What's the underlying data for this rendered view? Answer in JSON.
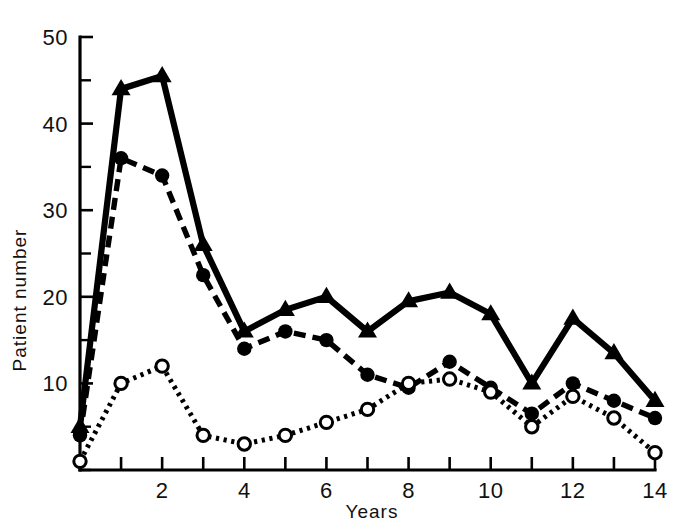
{
  "chart_data": {
    "type": "line",
    "title": "",
    "xlabel": "Years",
    "ylabel": "Patient number",
    "xlim": [
      0,
      14
    ],
    "ylim": [
      0,
      50
    ],
    "grid": false,
    "legend_position": "none",
    "x": [
      0,
      1,
      2,
      3,
      4,
      5,
      6,
      7,
      8,
      9,
      10,
      11,
      12,
      13,
      14
    ],
    "x_tick_values": [
      0,
      1,
      2,
      3,
      4,
      5,
      6,
      7,
      8,
      9,
      10,
      11,
      12,
      13,
      14
    ],
    "x_tick_labels": [
      "",
      "",
      "2",
      "",
      "4",
      "",
      "6",
      "",
      "8",
      "",
      "10",
      "",
      "12",
      "",
      "14"
    ],
    "y_tick_values": [
      0,
      5,
      10,
      15,
      20,
      25,
      30,
      35,
      40,
      45,
      50
    ],
    "y_tick_labels": [
      "",
      "",
      "10",
      "",
      "20",
      "",
      "30",
      "",
      "40",
      "",
      "50"
    ],
    "series": [
      {
        "name": "solid-triangle-series",
        "marker": "triangle",
        "line_style": "solid",
        "color": "#000000",
        "values": [
          5,
          44,
          45.5,
          26,
          16,
          18.5,
          20,
          16,
          19.5,
          20.5,
          18,
          10,
          17.5,
          13.5,
          8
        ]
      },
      {
        "name": "dashed-filled-circle-series",
        "marker": "filled-circle",
        "line_style": "dashed",
        "color": "#000000",
        "values": [
          4,
          36,
          34,
          22.5,
          14,
          16,
          15,
          11,
          9.5,
          12.5,
          9.5,
          6.5,
          10,
          8,
          6
        ]
      },
      {
        "name": "dotted-open-circle-series",
        "marker": "open-circle",
        "line_style": "dotted",
        "color": "#000000",
        "values": [
          1,
          10,
          12,
          4,
          3,
          4,
          5.5,
          7,
          10,
          10.5,
          9,
          5,
          8.5,
          6,
          2
        ]
      }
    ]
  },
  "axes": {
    "y_axis_title": "Patient number",
    "x_axis_title": "Years"
  },
  "colors": {
    "ink": "#000000",
    "background": "#ffffff"
  }
}
